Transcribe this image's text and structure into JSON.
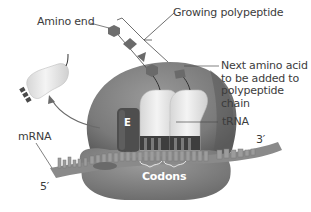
{
  "diagram": {
    "type": "biology-illustration",
    "labels": {
      "amino_end": "Amino end",
      "growing_polypeptide": "Growing polypeptide",
      "next_amino_acid": "Next amino acid\nto be added to\npolypeptide chain",
      "trna": "tRNA",
      "mrna": "mRNA",
      "five_prime": "5′",
      "three_prime": "3′",
      "codons": "Codons",
      "e_site": "E"
    },
    "colors": {
      "ribosome": "#7d7d7d",
      "ribosome_dark": "#5e5e5e",
      "trna": "#ececec",
      "amino_acid": "#6a6a6a",
      "mrna": "#8a8a8a",
      "e_site": "#4e4e4e",
      "leader_line": "#4a4a4a",
      "text": "#3c3c3c"
    }
  }
}
